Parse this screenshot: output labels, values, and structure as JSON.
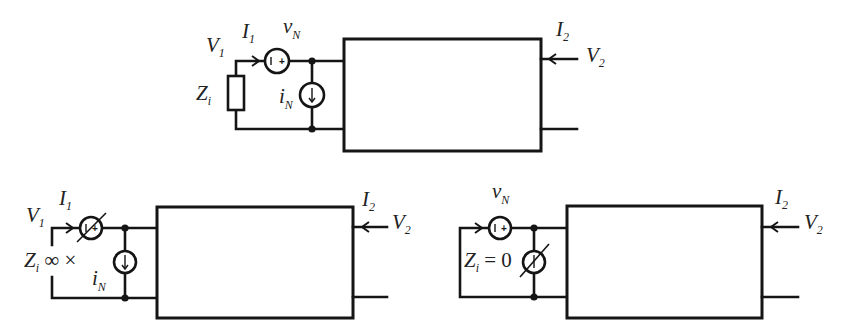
{
  "top": {
    "V1": {
      "main": "V",
      "sub": "1"
    },
    "I1": {
      "main": "I",
      "sub": "1"
    },
    "vN": {
      "main": "v",
      "sub": "N"
    },
    "Zi": {
      "main": "Z",
      "sub": "i"
    },
    "iN": {
      "main": "i",
      "sub": "N"
    },
    "I2": {
      "main": "I",
      "sub": "2"
    },
    "V2": {
      "main": "V",
      "sub": "2"
    },
    "voltage_source_polarity": "+"
  },
  "bottom_left": {
    "V1": {
      "main": "V",
      "sub": "1"
    },
    "I1": {
      "main": "I",
      "sub": "1"
    },
    "Zi": {
      "main": "Z",
      "sub": "i",
      "suffix": " ∞ ×"
    },
    "iN": {
      "main": "i",
      "sub": "N"
    },
    "I2": {
      "main": "I",
      "sub": "2"
    },
    "V2": {
      "main": "V",
      "sub": "2"
    },
    "voltage_source_polarity": "+"
  },
  "bottom_right": {
    "vN": {
      "main": "v",
      "sub": "N"
    },
    "Zi": {
      "main": "Z",
      "sub": "i",
      "suffix": " = 0"
    },
    "I2": {
      "main": "I",
      "sub": "2"
    },
    "V2": {
      "main": "V",
      "sub": "2"
    },
    "voltage_source_polarity": "+"
  }
}
